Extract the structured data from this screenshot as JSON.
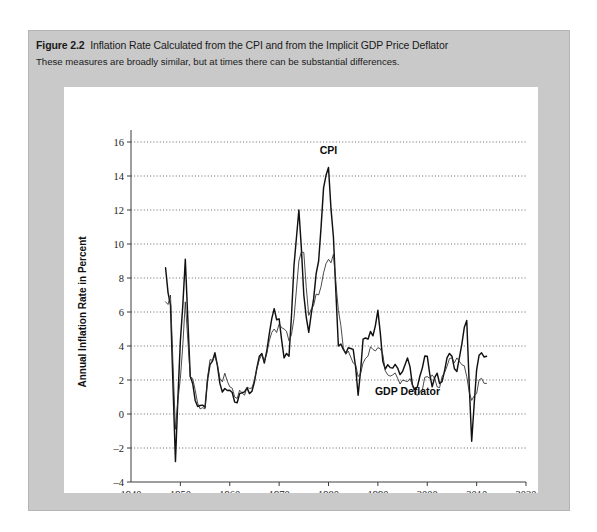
{
  "figure": {
    "label": "Figure 2.2",
    "title": "Inflation Rate Calculated from the CPI and from the Implicit GDP Price Deflator",
    "subtitle": "These measures are broadly similar, but at times there can be substantial differences."
  },
  "chart_data": {
    "type": "line",
    "title": "Inflation Rate Calculated from the CPI and from the Implicit GDP Price Deflator",
    "xlabel": "Year",
    "ylabel": "Annual Inflation Rate in Percent",
    "xlim": [
      1940,
      2020
    ],
    "ylim": [
      -4,
      16
    ],
    "xticks": [
      1940,
      1950,
      1960,
      1970,
      1980,
      1990,
      2000,
      2010,
      2020
    ],
    "yticks": [
      -4,
      -2,
      0,
      2,
      4,
      6,
      8,
      10,
      12,
      14,
      16
    ],
    "grid": "horizontal-dotted",
    "legend": "inline-annotations",
    "annotations": [
      {
        "text": "CPI",
        "x": 1980,
        "y": 15.3
      },
      {
        "text": "GDP Deflator",
        "x": 1996,
        "y": 1.1
      }
    ],
    "x": [
      1947,
      1948,
      1949,
      1950,
      1951,
      1952,
      1953,
      1954,
      1955,
      1956,
      1957,
      1958,
      1959,
      1960,
      1961,
      1962,
      1963,
      1964,
      1965,
      1966,
      1967,
      1968,
      1969,
      1970,
      1971,
      1972,
      1973,
      1974,
      1975,
      1976,
      1977,
      1978,
      1979,
      1980,
      1981,
      1982,
      1983,
      1984,
      1985,
      1986,
      1987,
      1988,
      1989,
      1990,
      1991,
      1992,
      1993,
      1994,
      1995,
      1996,
      1997,
      1998,
      1999,
      2000,
      2001,
      2002,
      2003,
      2004,
      2005,
      2006,
      2007,
      2008,
      2009,
      2010,
      2011,
      2012
    ],
    "series": [
      {
        "name": "CPI",
        "values": [
          8.6,
          6.4,
          -2.8,
          4.3,
          9.1,
          2.2,
          0.8,
          0.5,
          0.4,
          2.9,
          3.6,
          1.8,
          1.5,
          1.4,
          0.7,
          1.2,
          1.3,
          1.2,
          1.9,
          3.4,
          3.0,
          4.7,
          6.2,
          5.6,
          3.3,
          3.4,
          8.7,
          12.0,
          7.0,
          4.8,
          6.8,
          9.0,
          13.3,
          14.5,
          10.4,
          4.0,
          3.8,
          3.9,
          3.8,
          1.1,
          4.4,
          4.4,
          4.6,
          6.1,
          3.1,
          2.9,
          2.7,
          2.7,
          2.5,
          3.3,
          1.7,
          1.6,
          2.7,
          3.4,
          1.6,
          2.4,
          1.9,
          3.3,
          3.4,
          2.5,
          4.1,
          5.5,
          -1.6,
          2.6,
          3.6,
          3.4
        ]
      },
      {
        "name": "GDP Deflator",
        "values": [
          6.6,
          7.0,
          -0.9,
          2.1,
          6.6,
          2.2,
          1.4,
          0.3,
          0.3,
          3.2,
          3.4,
          2.1,
          2.4,
          1.6,
          1.0,
          1.4,
          1.1,
          1.5,
          2.0,
          3.2,
          3.1,
          4.3,
          5.0,
          5.3,
          5.0,
          4.3,
          5.6,
          9.0,
          9.5,
          5.8,
          6.4,
          7.0,
          8.3,
          9.1,
          9.4,
          6.1,
          3.9,
          3.7,
          3.0,
          2.2,
          3.0,
          3.4,
          3.8,
          3.9,
          3.5,
          2.3,
          2.3,
          2.1,
          2.0,
          1.9,
          1.7,
          1.1,
          1.4,
          2.2,
          2.3,
          1.6,
          2.2,
          2.8,
          3.3,
          3.3,
          2.9,
          2.2,
          0.8,
          1.2,
          2.1,
          1.8
        ]
      }
    ]
  }
}
